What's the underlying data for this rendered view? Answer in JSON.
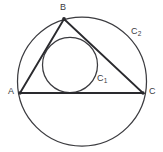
{
  "figure": {
    "background_color": "#ffffff",
    "stroke_color_circles": "#3b3b3f",
    "stroke_color_triangle": "#2a2a2e",
    "label_color": "#3a3a3e"
  },
  "labels": {
    "vertex_a": "A",
    "vertex_b": "B",
    "vertex_c": "C",
    "incircle_main": "C",
    "incircle_sub": "1",
    "circumcircle_main": "C",
    "circumcircle_sub": "2"
  },
  "geometry": {
    "circumcircle": {
      "name": "C2",
      "center_x": 82,
      "center_y": 81.5,
      "radius": 64.5
    },
    "incircle": {
      "name": "C1",
      "center_x": 70,
      "center_y": 65,
      "radius": 27.5
    },
    "triangle": {
      "points": "20,93 64,19 143,93",
      "vertices": [
        {
          "label": "A",
          "x": 20,
          "y": 93
        },
        {
          "label": "B",
          "x": 64,
          "y": 19
        },
        {
          "label": "C",
          "x": 143,
          "y": 93
        }
      ]
    }
  }
}
